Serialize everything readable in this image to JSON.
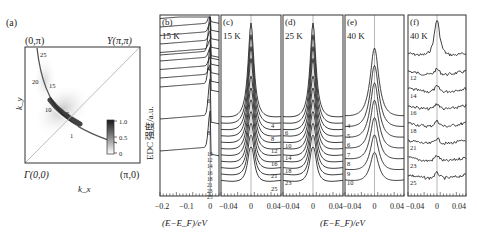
{
  "chart_data": [
    {
      "panel": "(a)",
      "type": "heatmap",
      "title": "",
      "xlabel": "k_x",
      "ylabel": "k_y",
      "corner_labels": {
        "top_left": "(0,π)",
        "top_right": "Y(π,π)",
        "bottom_left": "Γ(0,0)",
        "bottom_right": "(π,0)"
      },
      "cut_labels": [
        "1",
        "5",
        "10",
        "15",
        "20",
        "25"
      ],
      "colorbar": {
        "ticks": [
          "1.0",
          "0.5",
          "0"
        ],
        "range": [
          0,
          1.0
        ]
      },
      "diagonal_line": true
    },
    {
      "panel": "(b)",
      "type": "line",
      "temperature": "15 K",
      "xlabel": "(E−E_F)/eV",
      "ylabel": "EDC 强度/a.u.",
      "xticks": [
        "−0.2",
        "−0.1",
        "0"
      ],
      "xlim": [
        -0.22,
        0.04
      ],
      "curve_labels": [
        "4",
        "6",
        "8",
        "10",
        "12",
        "14",
        "16",
        "18",
        "21",
        "23",
        "25"
      ]
    },
    {
      "panel": "(c)",
      "type": "line",
      "temperature": "15 K",
      "xticks": [
        "−0.04",
        "0",
        "0.04"
      ],
      "xlim": [
        -0.06,
        0.06
      ],
      "curve_labels": [
        "4",
        "8",
        "12",
        "16",
        "21",
        "25"
      ]
    },
    {
      "panel": "(d)",
      "type": "line",
      "temperature": "25 K",
      "xticks": [
        "−0.04",
        "0",
        "0.04"
      ],
      "xlim": [
        -0.06,
        0.06
      ],
      "curve_labels": [
        "6",
        "10",
        "14",
        "18",
        "23"
      ]
    },
    {
      "panel": "(e)",
      "type": "line",
      "temperature": "40 K",
      "xticks": [
        "−0.04",
        "0",
        "0.04"
      ],
      "xlim": [
        -0.06,
        0.06
      ],
      "curve_labels": [
        "4",
        "5",
        "6",
        "7",
        "8",
        "9",
        "10"
      ]
    },
    {
      "panel": "(f)",
      "type": "line",
      "temperature": "40 K",
      "xticks": [
        "−0.04",
        "0",
        "0.04"
      ],
      "xlim": [
        -0.06,
        0.06
      ],
      "curve_labels": [
        "12",
        "14",
        "16",
        "18",
        "21",
        "23",
        "25"
      ]
    }
  ],
  "shared": {
    "xlabel_b": "(E−E_F)/eV",
    "xlabel_cf": "(E−E_F)/eV",
    "ylabel": "EDC 强度/a.u."
  },
  "colors": {
    "line": "#2a2a2a",
    "frame": "#333333",
    "grey_line": "#9a9a9a"
  }
}
